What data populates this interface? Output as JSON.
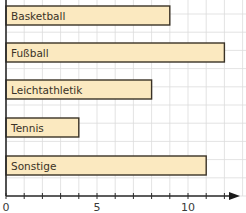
{
  "chart_data": {
    "type": "bar",
    "orientation": "horizontal",
    "title": "",
    "xlabel": "",
    "ylabel": "",
    "categories": [
      "Basketball",
      "Fußball",
      "Leichtathletik",
      "Tennis",
      "Sonstige"
    ],
    "values": [
      9,
      12,
      8,
      4,
      11
    ],
    "xlim": [
      0,
      13
    ],
    "x_ticks": [
      0,
      1,
      2,
      3,
      4,
      5,
      6,
      7,
      8,
      9,
      10,
      11,
      12
    ],
    "x_tick_labels": [
      "0",
      "5",
      "10"
    ],
    "grid": true,
    "legend": null,
    "labels_inside_bars": true,
    "colors": {
      "bar_fill": "#fbe9c0",
      "bar_stroke": "#3a3226",
      "grid": "#dcdcdc",
      "axis": "#2a2a2a"
    }
  }
}
